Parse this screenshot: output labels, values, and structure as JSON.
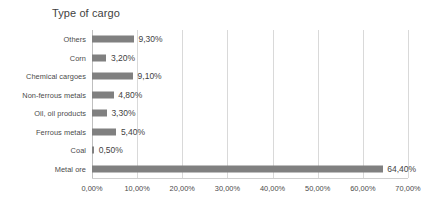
{
  "chart_data": {
    "type": "bar",
    "orientation": "horizontal",
    "title": "Type of cargo",
    "xlabel": "",
    "ylabel": "",
    "categories": [
      "Others",
      "Corn",
      "Chemical cargoes",
      "Non-ferrous metals",
      "Oil, oil products",
      "Ferrous metals",
      "Coal",
      "Metal ore"
    ],
    "values": [
      9.3,
      3.2,
      9.1,
      4.8,
      3.3,
      5.4,
      0.5,
      64.4
    ],
    "data_labels": [
      "9,30%",
      "3,20%",
      "9,10%",
      "4,80%",
      "3,30%",
      "5,40%",
      "0,50%",
      "64,40%"
    ],
    "xlim": [
      0,
      70
    ],
    "xticks": [
      0,
      10,
      20,
      30,
      40,
      50,
      60,
      70
    ],
    "xtick_labels": [
      "0,00%",
      "10,00%",
      "20,00%",
      "30,00%",
      "40,00%",
      "50,00%",
      "60,00%",
      "70,00%"
    ],
    "grid": true,
    "grid_axis": "x",
    "legend": false,
    "bar_color": "#808080",
    "gridline_color": "#d9d9d9",
    "text_color": "#3f3f3f",
    "background": "#ffffff"
  }
}
